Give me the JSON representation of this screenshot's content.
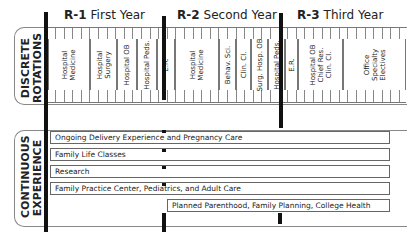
{
  "years": [
    {
      "code": "R-1",
      "label": "First Year"
    },
    {
      "code": "R-2",
      "label": "Second Year"
    },
    {
      "code": "R-3",
      "label": "Third Year"
    }
  ],
  "sections": {
    "discrete": "DISCRETE\nROTATIONS",
    "continuous": "CONTINUOUS\nEXPERIENCE"
  },
  "rotations": [
    {
      "label": "Hospital\nMedicine",
      "year": "R-1"
    },
    {
      "label": "Hospital\nSurgery",
      "year": "R-1"
    },
    {
      "label": "Hospital OB",
      "year": "R-1"
    },
    {
      "label": "Hospital Peds.",
      "year": "R-1"
    },
    {
      "label": "E.R.",
      "year": "R-1"
    },
    {
      "label": "Hospital\nMedicine",
      "year": "R-2"
    },
    {
      "label": "Behav. Sci.",
      "year": "R-2"
    },
    {
      "label": "Clin. Cl.",
      "year": "R-2"
    },
    {
      "label": "Surg. Hosp. OB",
      "year": "R-2"
    },
    {
      "label": "Hospital Peds.",
      "year": "R-2"
    },
    {
      "label": "E.R.",
      "year": "R-2"
    },
    {
      "label": "Hospital OB\nChief Res.\nClin. Cl.",
      "year": "R-3"
    },
    {
      "label": "Office\nSpecialty\nElectives",
      "year": "R-3"
    }
  ],
  "continuous": [
    {
      "label": "Ongoing Delivery Experience and Pregnancy Care"
    },
    {
      "label": "Family Life Classes"
    },
    {
      "label": "Research"
    },
    {
      "label": "Family Practice Center, Pediatrics, and Adult Care"
    },
    {
      "label": "Planned Parenthood, Family Planning, College Health"
    }
  ]
}
